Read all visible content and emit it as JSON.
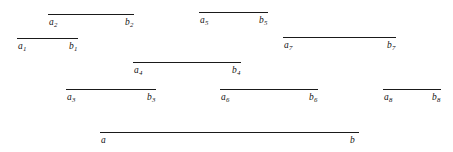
{
  "figure": {
    "background_color": "#ffffff",
    "line_color": "#1a1a1a",
    "width": 453,
    "height": 152
  },
  "chart_data": {
    "type": "line",
    "title": "",
    "xlabel": "",
    "ylabel": "",
    "grid": false,
    "legend": false,
    "xlim": [
      0,
      453
    ],
    "ylim": [
      0,
      152
    ],
    "segments": [
      {
        "id": "segment-2",
        "left_label": "a",
        "left_sub": "2",
        "right_label": "b",
        "right_sub": "2",
        "x1": 48,
        "x2": 134,
        "y": 14
      },
      {
        "id": "segment-5",
        "left_label": "a",
        "left_sub": "5",
        "right_label": "b",
        "right_sub": "5",
        "x1": 199,
        "x2": 268,
        "y": 12
      },
      {
        "id": "segment-1",
        "left_label": "a",
        "left_sub": "1",
        "right_label": "b",
        "right_sub": "1",
        "x1": 17,
        "x2": 78,
        "y": 38
      },
      {
        "id": "segment-7",
        "left_label": "a",
        "left_sub": "7",
        "right_label": "b",
        "right_sub": "7",
        "x1": 283,
        "x2": 396,
        "y": 37
      },
      {
        "id": "segment-4",
        "left_label": "a",
        "left_sub": "4",
        "right_label": "b",
        "right_sub": "4",
        "x1": 133,
        "x2": 241,
        "y": 62
      },
      {
        "id": "segment-3",
        "left_label": "a",
        "left_sub": "3",
        "right_label": "b",
        "right_sub": "3",
        "x1": 66,
        "x2": 156,
        "y": 89
      },
      {
        "id": "segment-6",
        "left_label": "a",
        "left_sub": "6",
        "right_label": "b",
        "right_sub": "6",
        "x1": 220,
        "x2": 318,
        "y": 89
      },
      {
        "id": "segment-8",
        "left_label": "a",
        "left_sub": "8",
        "right_label": "b",
        "right_sub": "8",
        "x1": 383,
        "x2": 441,
        "y": 89
      },
      {
        "id": "segment-main",
        "left_label": "a",
        "left_sub": "",
        "right_label": "b",
        "right_sub": "",
        "x1": 100,
        "x2": 359,
        "y": 132
      }
    ]
  }
}
